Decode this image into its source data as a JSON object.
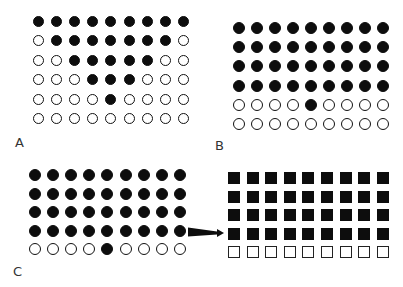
{
  "figure": {
    "panels": [
      {
        "id": "A",
        "label": "A",
        "shape": "circle",
        "origin": {
          "x": 38,
          "y": 21
        },
        "step": {
          "x": 18.2,
          "y": 19.5
        },
        "size": 11,
        "label_pos": {
          "x": 15,
          "y": 136
        },
        "rows": [
          [
            1,
            1,
            1,
            1,
            1,
            1,
            1,
            1,
            1
          ],
          [
            0,
            1,
            1,
            1,
            1,
            1,
            1,
            1,
            0
          ],
          [
            0,
            0,
            1,
            1,
            1,
            1,
            1,
            0,
            0
          ],
          [
            0,
            0,
            0,
            1,
            1,
            1,
            0,
            0,
            0
          ],
          [
            0,
            0,
            0,
            0,
            1,
            0,
            0,
            0,
            0
          ],
          [
            0,
            0,
            0,
            0,
            0,
            0,
            0,
            0,
            0
          ]
        ]
      },
      {
        "id": "B",
        "label": "B",
        "shape": "circle",
        "origin": {
          "x": 239,
          "y": 28
        },
        "step": {
          "x": 18.0,
          "y": 19.2
        },
        "size": 12,
        "label_pos": {
          "x": 215,
          "y": 139
        },
        "rows": [
          [
            1,
            1,
            1,
            1,
            1,
            1,
            1,
            1,
            1
          ],
          [
            1,
            1,
            1,
            1,
            1,
            1,
            1,
            1,
            1
          ],
          [
            1,
            1,
            1,
            1,
            1,
            1,
            1,
            1,
            1
          ],
          [
            1,
            1,
            1,
            1,
            1,
            1,
            1,
            1,
            1
          ],
          [
            0,
            0,
            0,
            0,
            1,
            0,
            0,
            0,
            0
          ],
          [
            0,
            0,
            0,
            0,
            0,
            0,
            0,
            0,
            0
          ]
        ]
      },
      {
        "id": "C",
        "label": "C",
        "shape": "circle",
        "origin": {
          "x": 35,
          "y": 175
        },
        "step": {
          "x": 18.1,
          "y": 18.6
        },
        "size": 12,
        "label_pos": {
          "x": 13,
          "y": 265
        },
        "rows": [
          [
            1,
            1,
            1,
            1,
            1,
            1,
            1,
            1,
            1
          ],
          [
            1,
            1,
            1,
            1,
            1,
            1,
            1,
            1,
            1
          ],
          [
            1,
            1,
            1,
            1,
            1,
            1,
            1,
            1,
            1
          ],
          [
            1,
            1,
            1,
            1,
            1,
            1,
            1,
            1,
            1
          ],
          [
            0,
            0,
            0,
            0,
            1,
            0,
            0,
            0,
            0
          ]
        ]
      },
      {
        "id": "C-right",
        "label": "",
        "shape": "square",
        "origin": {
          "x": 234,
          "y": 178
        },
        "step": {
          "x": 18.6,
          "y": 18.6
        },
        "size": 12,
        "rows": [
          [
            1,
            1,
            1,
            1,
            1,
            1,
            1,
            1,
            1
          ],
          [
            1,
            1,
            1,
            1,
            1,
            1,
            1,
            1,
            1
          ],
          [
            1,
            1,
            1,
            1,
            1,
            1,
            1,
            1,
            1
          ],
          [
            1,
            1,
            1,
            1,
            1,
            1,
            1,
            1,
            1
          ],
          [
            0,
            0,
            0,
            0,
            0,
            0,
            0,
            0,
            0
          ]
        ]
      }
    ],
    "arrow": {
      "from": {
        "x": 188,
        "y": 232
      },
      "to": {
        "x": 224,
        "y": 233
      },
      "direction": "right"
    },
    "colors": {
      "filled": "#0d0d0d",
      "outline": "#111111",
      "background": "#ffffff",
      "label": "#333333"
    }
  }
}
